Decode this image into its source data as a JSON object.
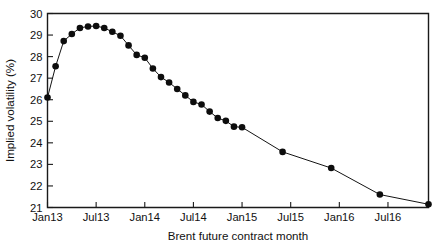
{
  "chart_data": {
    "type": "line",
    "title": "",
    "subtitle": "",
    "xlabel": "Brent future contract month",
    "ylabel": "Implied volatility (%)",
    "grid": false,
    "legend": null,
    "legend_position": "none",
    "marker": "filled-circle",
    "line_color": "#141414",
    "marker_color": "#0d0d0d",
    "xlim": [
      "Jan13",
      "Dec16"
    ],
    "ylim": [
      21,
      30
    ],
    "ytick_labels": [
      "21",
      "22",
      "23",
      "24",
      "25",
      "26",
      "27",
      "28",
      "29",
      "30"
    ],
    "ytick_values": [
      21,
      22,
      23,
      24,
      25,
      26,
      27,
      28,
      29,
      30
    ],
    "xtick_labels": [
      "Jan13",
      "Jul13",
      "Jan14",
      "Jul14",
      "Jan15",
      "Jul15",
      "Jan16",
      "Jul16"
    ],
    "xtick_values": [
      0,
      6,
      12,
      18,
      24,
      30,
      36,
      42
    ],
    "x_months": [
      0,
      1,
      2,
      3,
      4,
      5,
      6,
      7,
      8,
      9,
      10,
      11,
      12,
      13,
      14,
      15,
      16,
      17,
      18,
      19,
      20,
      21,
      22,
      23,
      24,
      29,
      35,
      41,
      47
    ],
    "x_labels": [
      "Jan13",
      "Feb13",
      "Mar13",
      "Apr13",
      "May13",
      "Jun13",
      "Jul13",
      "Aug13",
      "Sep13",
      "Oct13",
      "Nov13",
      "Dec13",
      "Jan14",
      "Feb14",
      "Mar14",
      "Apr14",
      "May14",
      "Jun14",
      "Jul14",
      "Aug14",
      "Sep14",
      "Oct14",
      "Nov14",
      "Dec14",
      "Jan15",
      "Jun15",
      "Dec15",
      "Jun16",
      "Dec16"
    ],
    "values": [
      26.1,
      27.55,
      28.72,
      29.05,
      29.33,
      29.4,
      29.42,
      29.33,
      29.15,
      28.97,
      28.52,
      28.08,
      27.95,
      27.45,
      27.05,
      26.8,
      26.5,
      26.2,
      25.9,
      25.78,
      25.45,
      25.15,
      25.02,
      24.75,
      24.72,
      23.58,
      22.83,
      21.6,
      21.15
    ]
  }
}
